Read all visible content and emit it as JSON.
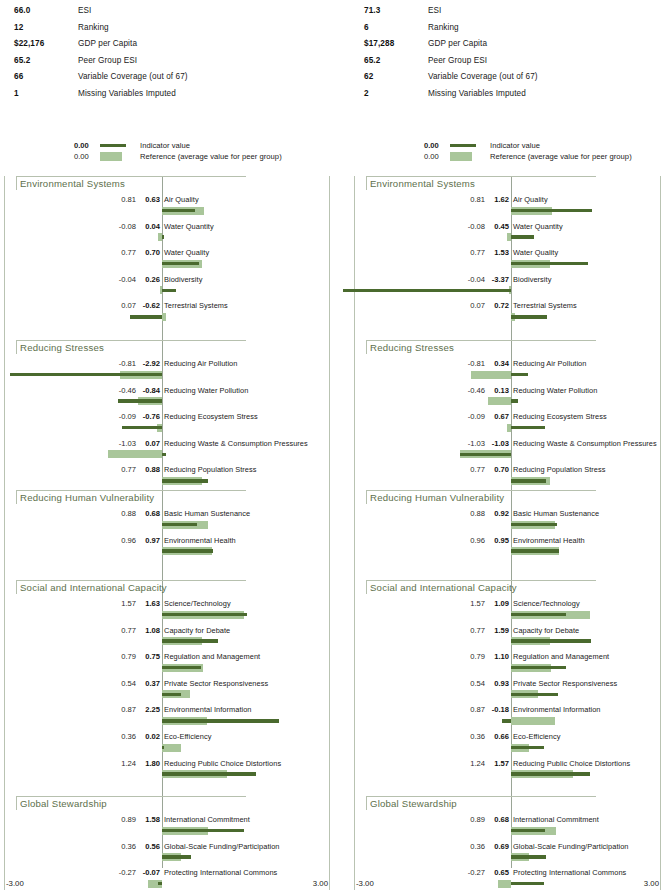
{
  "colors": {
    "indicator": "#4a6a2e",
    "reference": "#a9c69a",
    "section_title": "#5d6f4c",
    "frame": "#b9c3b2"
  },
  "legend": {
    "indicator_value": "0.00",
    "indicator_label": "Indicator value",
    "reference_value": "0.00",
    "reference_label": "Reference (average value for peer group)"
  },
  "axis": {
    "min_label": "-3.00",
    "max_label": "3.00",
    "min": -3.0,
    "max": 3.0
  },
  "panels": [
    {
      "id": "left",
      "summary": [
        {
          "value": "66.0",
          "label": "ESI"
        },
        {
          "value": "12",
          "label": "Ranking"
        },
        {
          "value": "$22,176",
          "label": "GDP per Capita"
        },
        {
          "value": "65.2",
          "label": "Peer Group ESI"
        },
        {
          "value": "66",
          "label": "Variable Coverage (out of 67)"
        },
        {
          "value": "1",
          "label": "Missing Variables Imputed"
        }
      ],
      "sections": [
        {
          "title": "Environmental Systems",
          "rows": [
            {
              "name": "Air Quality",
              "reference": 0.81,
              "indicator": 0.63
            },
            {
              "name": "Water Quantity",
              "reference": -0.08,
              "indicator": 0.04
            },
            {
              "name": "Water Quality",
              "reference": 0.77,
              "indicator": 0.7
            },
            {
              "name": "Biodiversity",
              "reference": -0.04,
              "indicator": 0.26
            },
            {
              "name": "Terrestrial Systems",
              "reference": 0.07,
              "indicator": -0.62
            }
          ]
        },
        {
          "title": "Reducing Stresses",
          "rows": [
            {
              "name": "Reducing Air Pollution",
              "reference": -0.81,
              "indicator": -2.92
            },
            {
              "name": "Reducing Water Pollution",
              "reference": -0.46,
              "indicator": -0.84
            },
            {
              "name": "Reducing Ecosystem Stress",
              "reference": -0.09,
              "indicator": -0.76
            },
            {
              "name": "Reducing Waste & Consumption Pressures",
              "reference": -1.03,
              "indicator": 0.07
            },
            {
              "name": "Reducing Population Stress",
              "reference": 0.77,
              "indicator": 0.88
            }
          ]
        },
        {
          "title": "Reducing Human Vulnerability",
          "rows": [
            {
              "name": "Basic Human Sustenance",
              "reference": 0.88,
              "indicator": 0.68
            },
            {
              "name": "Environmental Health",
              "reference": 0.96,
              "indicator": 0.97
            }
          ]
        },
        {
          "title": "Social and International Capacity",
          "rows": [
            {
              "name": "Science/Technology",
              "reference": 1.57,
              "indicator": 1.63
            },
            {
              "name": "Capacity for Debate",
              "reference": 0.77,
              "indicator": 1.08
            },
            {
              "name": "Regulation and Management",
              "reference": 0.79,
              "indicator": 0.75
            },
            {
              "name": "Private Sector Responsiveness",
              "reference": 0.54,
              "indicator": 0.37
            },
            {
              "name": "Environmental Information",
              "reference": 0.87,
              "indicator": 2.25
            },
            {
              "name": "Eco-Efficiency",
              "reference": 0.36,
              "indicator": 0.02
            },
            {
              "name": "Reducing Public Choice Distortions",
              "reference": 1.24,
              "indicator": 1.8
            }
          ]
        },
        {
          "title": "Global Stewardship",
          "rows": [
            {
              "name": "International Commitment",
              "reference": 0.89,
              "indicator": 1.58
            },
            {
              "name": "Global-Scale Funding/Participation",
              "reference": 0.36,
              "indicator": 0.56
            },
            {
              "name": "Protecting International Commons",
              "reference": -0.27,
              "indicator": -0.07
            }
          ]
        }
      ]
    },
    {
      "id": "right",
      "summary": [
        {
          "value": "71.3",
          "label": "ESI"
        },
        {
          "value": "6",
          "label": "Ranking"
        },
        {
          "value": "$17,288",
          "label": "GDP per Capita"
        },
        {
          "value": "65.2",
          "label": "Peer Group ESI"
        },
        {
          "value": "62",
          "label": "Variable Coverage (out of 67)"
        },
        {
          "value": "2",
          "label": "Missing Variables Imputed"
        }
      ],
      "sections": [
        {
          "title": "Environmental Systems",
          "rows": [
            {
              "name": "Air Quality",
              "reference": 0.81,
              "indicator": 1.62
            },
            {
              "name": "Water Quantity",
              "reference": -0.08,
              "indicator": 0.45
            },
            {
              "name": "Water Quality",
              "reference": 0.77,
              "indicator": 1.53
            },
            {
              "name": "Biodiversity",
              "reference": -0.04,
              "indicator": -3.37
            },
            {
              "name": "Terrestrial Systems",
              "reference": 0.07,
              "indicator": 0.72
            }
          ]
        },
        {
          "title": "Reducing Stresses",
          "rows": [
            {
              "name": "Reducing Air Pollution",
              "reference": -0.81,
              "indicator": 0.34
            },
            {
              "name": "Reducing Water Pollution",
              "reference": -0.46,
              "indicator": 0.13
            },
            {
              "name": "Reducing Ecosystem Stress",
              "reference": -0.09,
              "indicator": 0.67
            },
            {
              "name": "Reducing Waste & Consumption Pressures",
              "reference": -1.03,
              "indicator": -1.03
            },
            {
              "name": "Reducing Population Stress",
              "reference": 0.77,
              "indicator": 0.7
            }
          ]
        },
        {
          "title": "Reducing Human Vulnerability",
          "rows": [
            {
              "name": "Basic Human Sustenance",
              "reference": 0.88,
              "indicator": 0.92
            },
            {
              "name": "Environmental Health",
              "reference": 0.96,
              "indicator": 0.95
            }
          ]
        },
        {
          "title": "Social and International Capacity",
          "rows": [
            {
              "name": "Science/Technology",
              "reference": 1.57,
              "indicator": 1.09
            },
            {
              "name": "Capacity for Debate",
              "reference": 0.77,
              "indicator": 1.59
            },
            {
              "name": "Regulation and Management",
              "reference": 0.79,
              "indicator": 1.1
            },
            {
              "name": "Private Sector Responsiveness",
              "reference": 0.54,
              "indicator": 0.93
            },
            {
              "name": "Environmental Information",
              "reference": 0.87,
              "indicator": -0.18
            },
            {
              "name": "Eco-Efficiency",
              "reference": 0.36,
              "indicator": 0.66
            },
            {
              "name": "Reducing Public Choice Distortions",
              "reference": 1.24,
              "indicator": 1.57
            }
          ]
        },
        {
          "title": "Global Stewardship",
          "rows": [
            {
              "name": "International Commitment",
              "reference": 0.89,
              "indicator": 0.68
            },
            {
              "name": "Global-Scale Funding/Participation",
              "reference": 0.36,
              "indicator": 0.69
            },
            {
              "name": "Protecting International Commons",
              "reference": -0.27,
              "indicator": 0.65
            }
          ]
        }
      ]
    }
  ],
  "chart_data": {
    "type": "bar",
    "xlabel": "Standardized value",
    "ylabel": "Indicator",
    "xlim": [
      -3.0,
      3.0
    ],
    "grid": false,
    "legend_position": "top",
    "orientation": "horizontal",
    "series": [
      {
        "name": "Indicator value",
        "color": "#4a6a2e"
      },
      {
        "name": "Reference (average value for peer group)",
        "color": "#a9c69a"
      }
    ],
    "categories": [
      "Air Quality",
      "Water Quantity",
      "Water Quality",
      "Biodiversity",
      "Terrestrial Systems",
      "Reducing Air Pollution",
      "Reducing Water Pollution",
      "Reducing Ecosystem Stress",
      "Reducing Waste & Consumption Pressures",
      "Reducing Population Stress",
      "Basic Human Sustenance",
      "Environmental Health",
      "Science/Technology",
      "Capacity for Debate",
      "Regulation and Management",
      "Private Sector Responsiveness",
      "Environmental Information",
      "Eco-Efficiency",
      "Reducing Public Choice Distortions",
      "International Commitment",
      "Global-Scale Funding/Participation",
      "Protecting International Commons"
    ],
    "reference_values": [
      0.81,
      -0.08,
      0.77,
      -0.04,
      0.07,
      -0.81,
      -0.46,
      -0.09,
      -1.03,
      0.77,
      0.88,
      0.96,
      1.57,
      0.77,
      0.79,
      0.54,
      0.87,
      0.36,
      1.24,
      0.89,
      0.36,
      -0.27
    ],
    "left_panel_indicator_values": [
      0.63,
      0.04,
      0.7,
      0.26,
      -0.62,
      -2.92,
      -0.84,
      -0.76,
      0.07,
      0.88,
      0.68,
      0.97,
      1.63,
      1.08,
      0.75,
      0.37,
      2.25,
      0.02,
      1.8,
      1.58,
      0.56,
      -0.07
    ],
    "right_panel_indicator_values": [
      1.62,
      0.45,
      1.53,
      -3.37,
      0.72,
      0.34,
      0.13,
      0.67,
      -1.03,
      0.7,
      0.92,
      0.95,
      1.09,
      1.59,
      1.1,
      0.93,
      -0.18,
      0.66,
      1.57,
      0.68,
      0.69,
      0.65
    ]
  }
}
